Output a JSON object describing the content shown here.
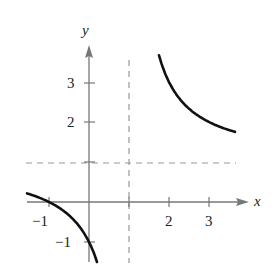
{
  "chart_data": {
    "type": "line",
    "title": "",
    "function": "y = (x + 1) / (x - 1)",
    "xlabel": "x",
    "ylabel": "y",
    "xlim": [
      -1.55,
      3.9
    ],
    "ylim": [
      -1.5,
      3.9
    ],
    "x_ticks": [
      -1,
      1,
      2,
      3
    ],
    "x_tick_labels": [
      "−1",
      "",
      "2",
      "3"
    ],
    "y_ticks": [
      -1,
      1,
      2,
      3
    ],
    "y_tick_labels": [
      "−1",
      "",
      "2",
      "3"
    ],
    "asymptotes": {
      "vertical": 1,
      "horizontal": 1
    },
    "series": [
      {
        "name": "left-branch",
        "x_range": [
          -1.55,
          0.2
        ],
        "points": [
          [
            -1.55,
            0.22
          ],
          [
            -1,
            0
          ],
          [
            -0.5,
            -0.33
          ],
          [
            0,
            -1
          ],
          [
            0.2,
            -1.5
          ]
        ]
      },
      {
        "name": "right-branch",
        "x_range": [
          1.75,
          3.65
        ],
        "points": [
          [
            1.75,
            3.67
          ],
          [
            2,
            3
          ],
          [
            2.5,
            2.33
          ],
          [
            3,
            2
          ],
          [
            3.65,
            1.75
          ]
        ]
      }
    ],
    "grid": false,
    "legend": null
  },
  "labels": {
    "x_axis": "x",
    "y_axis": "y",
    "tick_x_neg1": "−1",
    "tick_x_2": "2",
    "tick_x_3": "3",
    "tick_y_neg1": "−1",
    "tick_y_2": "2",
    "tick_y_3": "3"
  },
  "colors": {
    "axis": "#777777",
    "curve": "#111111",
    "dash": "#999999"
  }
}
